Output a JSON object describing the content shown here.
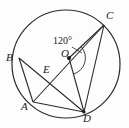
{
  "figure": {
    "type": "circle-geometry-diagram",
    "background_color": "#fdfdfd",
    "stroke_color": "#1a1a1a",
    "circle": {
      "center_label": "O",
      "cx": 66,
      "cy": 64,
      "r": 54
    },
    "points": [
      {
        "id": "A",
        "label": "A",
        "x": 33,
        "y": 102,
        "on_circle": true,
        "label_x": 21,
        "label_y": 101
      },
      {
        "id": "B",
        "label": "B",
        "x": 19,
        "y": 58,
        "on_circle": true,
        "label_x": 6,
        "label_y": 52
      },
      {
        "id": "C",
        "label": "C",
        "x": 104,
        "y": 25,
        "on_circle": true,
        "label_x": 106,
        "label_y": 10
      },
      {
        "id": "D",
        "label": "D",
        "x": 84,
        "y": 112,
        "on_circle": true,
        "label_x": 83,
        "label_y": 113
      },
      {
        "id": "E",
        "label": "E",
        "x": 49,
        "y": 73,
        "on_circle": false,
        "label_x": 43,
        "label_y": 64
      },
      {
        "id": "O",
        "label": "O",
        "x": 69,
        "y": 58,
        "on_circle": false,
        "label_x": 61,
        "label_y": 48
      }
    ],
    "segments": [
      {
        "name": "chord-B-D",
        "from": "B",
        "to": "D"
      },
      {
        "name": "chord-A-C",
        "from": "A",
        "to": "C"
      },
      {
        "name": "chord-A-B",
        "from": "B",
        "to": "A"
      },
      {
        "name": "chord-A-D",
        "from": "A",
        "to": "D"
      },
      {
        "name": "chord-C-D",
        "from": "C",
        "to": "D"
      },
      {
        "name": "radius-O-C",
        "from": "O",
        "to": "C"
      },
      {
        "name": "radius-O-D",
        "from": "O",
        "to": "D"
      }
    ],
    "angle_marks": [
      {
        "name": "central-angle-COD",
        "value_label": "120°",
        "vertex": "O",
        "label_x": 53,
        "label_y": 36
      }
    ]
  }
}
